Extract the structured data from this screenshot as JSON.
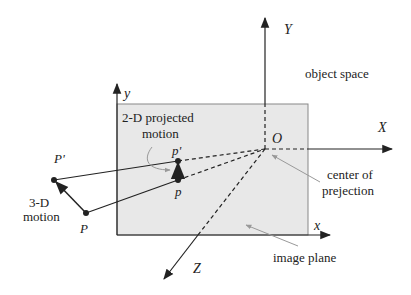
{
  "figure": {
    "type": "perspective projection diagram",
    "colors": {
      "plane_fill": "#e8e8e8",
      "plane_border": "#777777",
      "line": "#222222",
      "pointer": "#999999",
      "background": "#ffffff"
    },
    "axes": {
      "world": {
        "Y": "Y",
        "X": "X",
        "Z": "Z",
        "origin": "O"
      },
      "image": {
        "y": "y",
        "x": "x"
      }
    },
    "points": {
      "P": "P",
      "P_prime": "P'",
      "p": "p",
      "p_prime": "p'"
    },
    "labels": {
      "object_space": "object space",
      "projected_motion_line1": "2-D projected",
      "projected_motion_line2": "motion",
      "motion_3d_line1": "3-D",
      "motion_3d_line2": "motion",
      "center_line1": "center of",
      "center_line2": "prejection",
      "image_plane": "image plane"
    }
  }
}
